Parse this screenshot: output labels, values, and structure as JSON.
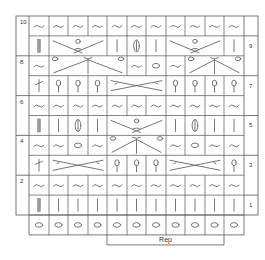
{
  "chart": {
    "title": "",
    "columns": 11,
    "rep_label": "Rep",
    "rep_columns": [
      5,
      10
    ],
    "line_color": "#555555",
    "symbol_color": "#666666",
    "rows": [
      {
        "row": 10,
        "label": "10",
        "side": "left",
        "cells": [
          "purl",
          "purl",
          "purl",
          "purl",
          "purl",
          "purl",
          "purl",
          "purl",
          "purl",
          "purl",
          "purl"
        ]
      },
      {
        "row": 9,
        "label": "9",
        "side": "right",
        "cells": [
          "k2tog-bar",
          "cross-4-top",
          "",
          "",
          "knit",
          "knit-tbl",
          "knit",
          "cross-4-top",
          "",
          "",
          "knit"
        ]
      },
      {
        "row": 8,
        "label": "8",
        "side": "left",
        "cells": [
          "purl",
          "cluster-5-bottom",
          "",
          "",
          "",
          "purl",
          "yo",
          "purl",
          "cluster-5-bottom",
          "",
          "",
          "purl"
        ]
      },
      {
        "row": 7,
        "label": "7",
        "side": "right",
        "cells": [
          "twist-left",
          "bobble",
          "bobble",
          "bobble",
          "cross-3",
          "",
          "",
          "bobble",
          "bobble",
          "bobble",
          "bobble"
        ]
      },
      {
        "row": 6,
        "label": "6",
        "side": "left",
        "cells": [
          "purl",
          "purl",
          "purl",
          "purl",
          "purl",
          "purl",
          "purl",
          "purl",
          "purl",
          "purl",
          "purl"
        ]
      },
      {
        "row": 5,
        "label": "5",
        "side": "right",
        "cells": [
          "k2tog-bar",
          "knit",
          "knit-tbl",
          "knit",
          "cross-4-top",
          "",
          "",
          "knit",
          "knit-tbl",
          "knit",
          "knit"
        ]
      },
      {
        "row": 4,
        "label": "4",
        "side": "left",
        "cells": [
          "purl",
          "purl",
          "yo",
          "purl",
          "cluster-5-bottom",
          "",
          "",
          "purl",
          "yo",
          "purl",
          "purl"
        ]
      },
      {
        "row": 3,
        "label": "3",
        "side": "right",
        "cells": [
          "twist-left",
          "cross-3",
          "",
          "",
          "bobble",
          "bobble",
          "bobble",
          "cross-3",
          "",
          "",
          "bobble"
        ]
      },
      {
        "row": 2,
        "label": "2",
        "side": "left",
        "cells": [
          "purl",
          "purl",
          "purl",
          "purl",
          "purl",
          "purl",
          "purl",
          "purl",
          "purl",
          "purl",
          "purl"
        ]
      },
      {
        "row": 1,
        "label": "1",
        "side": "right",
        "cells": [
          "k2tog-bar",
          "knit",
          "knit",
          "knit",
          "knit",
          "knit",
          "knit",
          "knit",
          "knit",
          "knit",
          "knit"
        ]
      },
      {
        "row": 0,
        "label": "",
        "side": "none",
        "cells": [
          "yo",
          "yo",
          "yo",
          "yo",
          "yo",
          "yo",
          "yo",
          "yo",
          "yo",
          "yo",
          "yo"
        ]
      }
    ],
    "row_labels_left": [
      "10",
      "8",
      "6",
      "4",
      "2"
    ],
    "row_labels_right": [
      "9",
      "7",
      "5",
      "3",
      "1"
    ]
  }
}
